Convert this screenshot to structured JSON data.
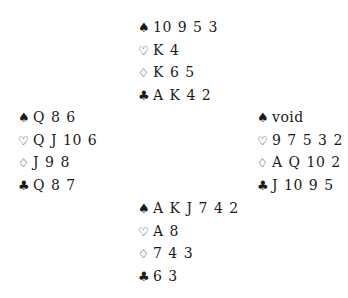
{
  "suit_icons": {
    "spades": "♠",
    "hearts": "♡",
    "diamonds": "♢",
    "clubs": "♣"
  },
  "hands": {
    "north": {
      "spades": "10 9 5 3",
      "hearts": "K 4",
      "diamonds": "K 6 5",
      "clubs": "A K 4 2"
    },
    "west": {
      "spades": "Q 8 6",
      "hearts": "Q J 10 6",
      "diamonds": "J 9 8",
      "clubs": "Q 8 7"
    },
    "east": {
      "spades": "void",
      "hearts": "9 7 5 3 2",
      "diamonds": "A Q 10 2",
      "clubs": "J 10 9 5"
    },
    "south": {
      "spades": "A K J 7 4 2",
      "hearts": "A 8",
      "diamonds": "7 4 3",
      "clubs": "6 3"
    }
  }
}
